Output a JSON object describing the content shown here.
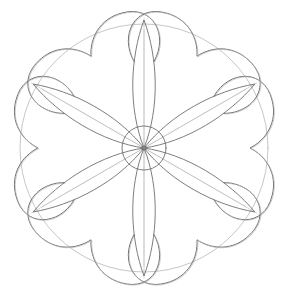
{
  "image": {
    "description": "Pencil sketch of a six-petal flower with heart-shaped petals, inner pointed leaves and construction circles",
    "width": 286,
    "height": 298,
    "center": [
      144,
      148
    ],
    "guide_circle_radius": 124,
    "inner_circle_radius": 22,
    "petal_count": 6,
    "colors": {
      "background": "#ffffff",
      "stroke_dark": "#6e6e6e",
      "stroke_light": "#b8b8b8"
    }
  }
}
